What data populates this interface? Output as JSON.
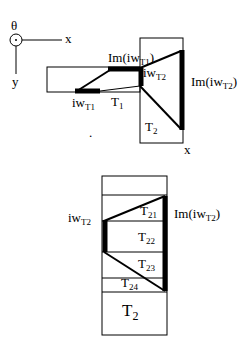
{
  "axes": {
    "theta": "θ",
    "x": "x",
    "y": "y"
  },
  "top_diagram": {
    "label_im_iw_t1_prefix": "Im(iw",
    "label_im_iw_t1_sub": "T1",
    "label_im_iw_t1_suffix": ")",
    "label_iw_t1_prefix": "iw",
    "label_iw_t1_sub": "T1",
    "label_t1": "T",
    "label_t1_sub": "1",
    "label_iw_t2_prefix": "iw",
    "label_iw_t2_sub": "T2",
    "label_im_iw_t2_prefix": "Im(iw",
    "label_im_iw_t2_sub": "T2",
    "label_im_iw_t2_suffix": ")",
    "label_t2": "T",
    "label_t2_sub": "2",
    "label_x": "x",
    "dot": "."
  },
  "bottom_diagram": {
    "label_iw_t2_prefix": "iw",
    "label_iw_t2_sub": "T2",
    "label_im_iw_t2_prefix": "Im(iw",
    "label_im_iw_t2_sub": "T2",
    "label_im_iw_t2_suffix": ")",
    "sections": [
      {
        "label": "T",
        "sub": "21"
      },
      {
        "label": "T",
        "sub": "22"
      },
      {
        "label": "T",
        "sub": "23"
      },
      {
        "label": "T",
        "sub": "24"
      },
      {
        "label": "T",
        "sub": "2"
      }
    ]
  }
}
